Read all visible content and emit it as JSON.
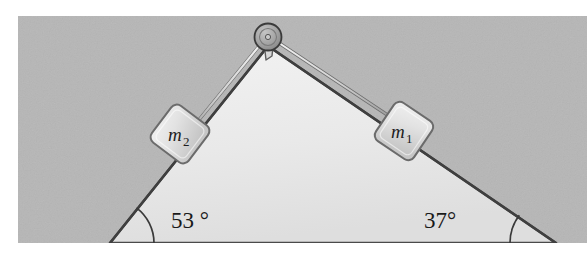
{
  "figure": {
    "name": "inclined-plane-pulley-diagram",
    "canvas": {
      "width": 587,
      "height": 255
    },
    "background_panel": {
      "name": "gray-backdrop",
      "color": "#b6b6b6",
      "x": 18,
      "y": 16,
      "width": 569,
      "height": 227
    },
    "wedge": {
      "name": "triangular-incline",
      "fill": "#e9e9e9",
      "edge_color": "#4a4a4a",
      "apex": {
        "x": 268,
        "y": 46
      },
      "left_base": {
        "x": 110,
        "y": 243
      },
      "right_base": {
        "x": 556,
        "y": 243
      }
    },
    "pulley": {
      "name": "pulley-wheel",
      "cx": 268,
      "cy": 37,
      "r": 13,
      "fill": "#9e9e9e",
      "stroke": "#3c3c3c",
      "bracket_fill": "#d5d5d5"
    },
    "ropes": [
      {
        "name": "rope-left",
        "color": "#cfcfcf",
        "stroke": "#6e6e6e"
      },
      {
        "name": "rope-right",
        "color": "#cfcfcf",
        "stroke": "#6e6e6e"
      }
    ],
    "blocks": [
      {
        "id": "m2",
        "name": "block-m2",
        "label": "m",
        "subscript": "2",
        "cx": 180,
        "cy": 134,
        "size": 46,
        "rotation_deg": -53,
        "fill": "#dcdcdc",
        "stroke": "#707070"
      },
      {
        "id": "m1",
        "name": "block-m1",
        "label": "m",
        "subscript": "1",
        "cx": 404,
        "cy": 131,
        "size": 46,
        "rotation_deg": 37,
        "fill": "#dcdcdc",
        "stroke": "#707070"
      }
    ],
    "angles": [
      {
        "id": "left-angle",
        "name": "angle-label-53",
        "text": "53 °",
        "value": 53,
        "unit": "degrees",
        "x": 171,
        "y": 228,
        "arc_vertex": {
          "x": 110,
          "y": 243
        },
        "arc_radius": 44
      },
      {
        "id": "right-angle",
        "name": "angle-label-37",
        "text": "37°",
        "value": 37,
        "unit": "degrees",
        "x": 424,
        "y": 228,
        "arc_vertex": {
          "x": 556,
          "y": 243
        },
        "arc_radius": 46
      }
    ]
  }
}
